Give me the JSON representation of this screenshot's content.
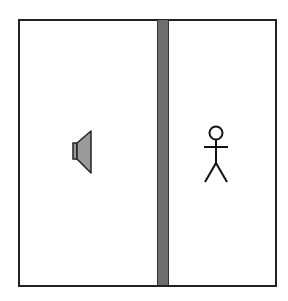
{
  "diagram": {
    "elements": [
      {
        "type": "room-boundary",
        "label": ""
      },
      {
        "type": "wall",
        "label": "",
        "color": "#6e6e6e"
      },
      {
        "type": "speaker-icon",
        "side": "left",
        "color": "#9a9a9a"
      },
      {
        "type": "person-icon",
        "side": "right"
      }
    ]
  }
}
